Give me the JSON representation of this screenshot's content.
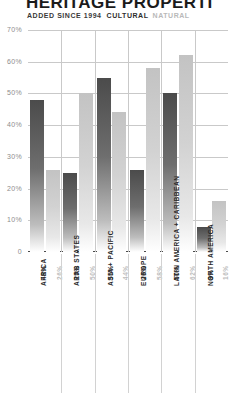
{
  "header": {
    "title": "HERITAGE PROPERTI",
    "legend_added": "ADDED SINCE 1994",
    "legend_cultural": "CULTURAL",
    "legend_natural": "NATURAL"
  },
  "colors": {
    "cultural": "#4b4b4b",
    "natural": "#c3c3c3",
    "grid": "#c9c9c9",
    "axis": "#4a4a4a",
    "text": "#2b2b2b",
    "muted": "#8d8d8d"
  },
  "chart_data": {
    "type": "bar",
    "title": "HERITAGE PROPERTI",
    "subtitle": "ADDED SINCE 1994",
    "xlabel": "",
    "ylabel": "",
    "ylim": [
      0,
      70
    ],
    "grid": true,
    "legend_position": "top",
    "ticks": [
      "70%",
      "60%",
      "50%",
      "40%",
      "30%",
      "20%",
      "10%",
      "0"
    ],
    "tick_values": [
      70,
      60,
      50,
      40,
      30,
      20,
      10,
      0
    ],
    "categories": [
      "AFRICA",
      "ARAB STATES",
      "ASIA + PACIFIC",
      "EUROPE",
      "LATIN AMERICA + CARIBBEAN",
      "NORTH AMERICA"
    ],
    "series": [
      {
        "name": "CULTURAL",
        "values": [
          48,
          25,
          55,
          26,
          50,
          8
        ]
      },
      {
        "name": "NATURAL",
        "values": [
          26,
          50,
          44,
          58,
          62,
          16
        ]
      }
    ],
    "value_labels": [
      {
        "cultural": "48%",
        "natural": "26%"
      },
      {
        "cultural": "25%",
        "natural": "50%"
      },
      {
        "cultural": "55%",
        "natural": "44%"
      },
      {
        "cultural": "26%",
        "natural": "58%"
      },
      {
        "cultural": "50%",
        "natural": "62%"
      },
      {
        "cultural": "8%",
        "natural": "16%"
      }
    ]
  }
}
